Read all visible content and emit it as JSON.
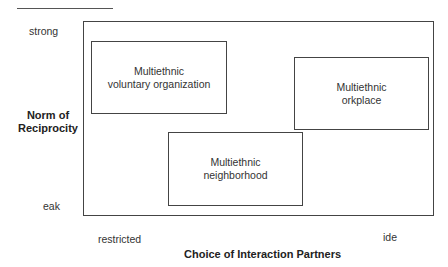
{
  "diagram": {
    "y_axis": {
      "title_line1": "Norm of",
      "title_line2": "Reciprocity",
      "high_label": "strong",
      "low_label": "eak"
    },
    "x_axis": {
      "title": "Choice of Interaction Partners",
      "low_label": "restricted",
      "high_label": "ide"
    },
    "boxes": [
      {
        "id": "voluntary-organization",
        "line1": "Multiethnic",
        "line2": "voluntary organization",
        "position": "restricted choice, strong reciprocity"
      },
      {
        "id": "workplace",
        "line1": "Multiethnic",
        "line2": "orkplace",
        "position": "wide choice, moderately strong reciprocity"
      },
      {
        "id": "neighborhood",
        "line1": "Multiethnic",
        "line2": "neighborhood",
        "position": "intermediate choice, weak reciprocity"
      }
    ]
  }
}
